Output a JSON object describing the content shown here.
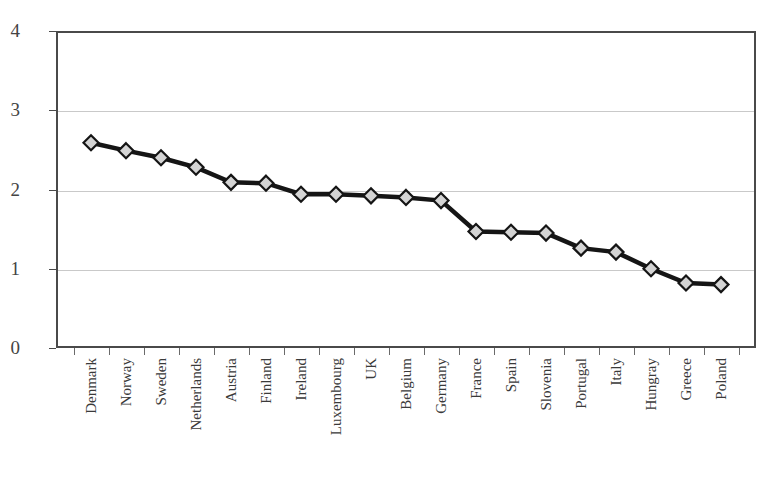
{
  "chart_data": {
    "type": "line",
    "title": "",
    "subtitle": "",
    "xlabel": "",
    "ylabel": "",
    "ylim": [
      0,
      4
    ],
    "yticks": [
      0,
      1,
      2,
      3,
      4
    ],
    "ytick_labels": [
      "0",
      "1",
      "2",
      "3",
      "4"
    ],
    "grid": "horizontal",
    "legend": "none",
    "categories": [
      "Denmark",
      "Norway",
      "Sweden",
      "Netherlands",
      "Austria",
      "Finland",
      "Ireland",
      "Luxembourg",
      "UK",
      "Belgium",
      "Germany",
      "France",
      "Spain",
      "Slovenia",
      "Portugal",
      "Italy",
      "Hungray",
      "Greece",
      "Poland"
    ],
    "values": [
      2.59,
      2.49,
      2.4,
      2.28,
      2.09,
      2.08,
      1.94,
      1.94,
      1.92,
      1.9,
      1.86,
      1.47,
      1.46,
      1.45,
      1.26,
      1.21,
      1.0,
      0.82,
      0.8
    ],
    "marker": "diamond",
    "marker_fill_color": "#d4d4d4",
    "marker_edge_color": "#151515",
    "line_color": "#151515",
    "grid_color": "#c9c9c9",
    "axis_color": "#4a4a4a",
    "background_color": "#ffffff"
  }
}
